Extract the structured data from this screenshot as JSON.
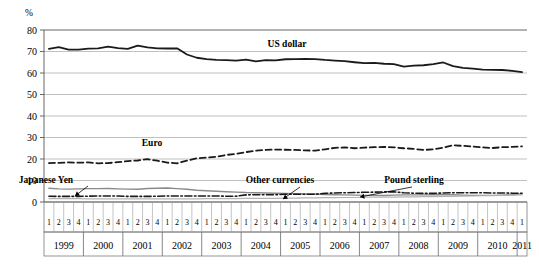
{
  "chart_data": {
    "type": "line",
    "title": "",
    "xlabel": "",
    "ylabel": "%",
    "ylim": [
      0,
      80
    ],
    "yticks": [
      0,
      10,
      20,
      30,
      40,
      50,
      60,
      70,
      80
    ],
    "grid": true,
    "legend_position": "inline-annotations",
    "years": [
      "1999",
      "2000",
      "2001",
      "2002",
      "2003",
      "2004",
      "2005",
      "2006",
      "2007",
      "2008",
      "2009",
      "2010",
      "2011"
    ],
    "quarters_per_year": [
      4,
      4,
      4,
      4,
      4,
      4,
      4,
      4,
      4,
      4,
      4,
      4,
      1
    ],
    "quarter_labels": [
      "1",
      "2",
      "3",
      "4"
    ],
    "x": [
      "1999 Q1",
      "1999 Q2",
      "1999 Q3",
      "1999 Q4",
      "2000 Q1",
      "2000 Q2",
      "2000 Q3",
      "2000 Q4",
      "2001 Q1",
      "2001 Q2",
      "2001 Q3",
      "2001 Q4",
      "2002 Q1",
      "2002 Q2",
      "2002 Q3",
      "2002 Q4",
      "2003 Q1",
      "2003 Q2",
      "2003 Q3",
      "2003 Q4",
      "2004 Q1",
      "2004 Q2",
      "2004 Q3",
      "2004 Q4",
      "2005 Q1",
      "2005 Q2",
      "2005 Q3",
      "2005 Q4",
      "2006 Q1",
      "2006 Q2",
      "2006 Q3",
      "2006 Q4",
      "2007 Q1",
      "2007 Q2",
      "2007 Q3",
      "2007 Q4",
      "2008 Q1",
      "2008 Q2",
      "2008 Q3",
      "2008 Q4",
      "2009 Q1",
      "2009 Q2",
      "2009 Q3",
      "2009 Q4",
      "2010 Q1",
      "2010 Q2",
      "2010 Q3",
      "2010 Q4",
      "2011 Q1"
    ],
    "series": [
      {
        "name": "US dollar",
        "style": "solid",
        "color": "#1a1a1a",
        "width": 1.8,
        "label_x": 287,
        "label_y": 47,
        "values": [
          71.2,
          72.0,
          70.9,
          70.9,
          71.3,
          71.5,
          72.3,
          71.6,
          71.2,
          72.7,
          71.9,
          71.5,
          71.4,
          71.5,
          68.6,
          67.1,
          66.5,
          66.1,
          66.0,
          65.8,
          66.2,
          65.4,
          66.0,
          65.9,
          66.4,
          66.5,
          66.6,
          66.5,
          66.1,
          65.8,
          65.5,
          65.0,
          64.6,
          64.7,
          64.3,
          64.1,
          63.0,
          63.4,
          63.6,
          64.1,
          64.9,
          63.2,
          62.4,
          62.0,
          61.6,
          61.5,
          61.4,
          61.0,
          60.4
        ]
      },
      {
        "name": "Euro",
        "style": "dashed",
        "color": "#1a1a1a",
        "width": 1.8,
        "label_x": 152,
        "label_y": 146,
        "values": [
          18.1,
          18.2,
          18.4,
          18.3,
          18.4,
          18.0,
          18.1,
          18.5,
          19.0,
          19.3,
          19.9,
          19.2,
          18.3,
          18.0,
          19.2,
          20.3,
          20.7,
          21.0,
          21.9,
          22.4,
          23.2,
          23.9,
          24.2,
          24.4,
          24.3,
          24.2,
          24.0,
          23.9,
          24.5,
          25.2,
          25.4,
          25.0,
          25.3,
          25.5,
          25.6,
          25.4,
          25.0,
          24.7,
          24.2,
          24.5,
          25.3,
          26.4,
          26.1,
          25.8,
          25.4,
          25.1,
          25.5,
          25.6,
          25.9
        ]
      },
      {
        "name": "Japanese Yen",
        "style": "solid",
        "color": "#8a8a8a",
        "width": 1.4,
        "label_x": 46,
        "label_y": 183,
        "leader": {
          "x1": 88,
          "y1": 186,
          "x2": 75,
          "y2": 196
        },
        "values": [
          6.4,
          6.1,
          6.0,
          6.1,
          6.2,
          6.2,
          6.3,
          6.1,
          6.0,
          5.9,
          6.3,
          6.4,
          6.5,
          6.2,
          5.9,
          5.5,
          5.2,
          5.0,
          4.8,
          4.6,
          4.4,
          4.3,
          4.2,
          4.1,
          4.0,
          3.9,
          3.8,
          3.7,
          3.5,
          3.4,
          3.3,
          3.2,
          3.1,
          3.0,
          3.0,
          3.2,
          3.3,
          3.3,
          3.3,
          3.4,
          3.5,
          3.4,
          3.2,
          3.1,
          3.1,
          3.1,
          3.2,
          3.4,
          3.8
        ]
      },
      {
        "name": "Pound sterling",
        "style": "dashdot",
        "color": "#1a1a1a",
        "width": 1.6,
        "label_x": 414,
        "label_y": 183,
        "leader": {
          "x1": 412,
          "y1": 187,
          "x2": 360,
          "y2": 197
        },
        "values": [
          2.7,
          2.6,
          2.6,
          2.6,
          2.7,
          2.8,
          2.8,
          2.8,
          2.6,
          2.6,
          2.6,
          2.7,
          2.8,
          2.8,
          2.8,
          2.8,
          2.8,
          2.8,
          2.7,
          2.7,
          3.3,
          3.4,
          3.4,
          3.4,
          3.6,
          3.6,
          3.6,
          3.6,
          4.0,
          4.2,
          4.3,
          4.4,
          4.5,
          4.6,
          4.7,
          4.7,
          4.3,
          4.1,
          4.0,
          4.0,
          4.2,
          4.3,
          4.3,
          4.3,
          4.3,
          4.2,
          4.2,
          4.1,
          4.1
        ]
      },
      {
        "name": "Other currencies",
        "style": "solid",
        "color": "#b3b3b3",
        "width": 1.2,
        "label_x": 280,
        "label_y": 183,
        "leader": {
          "x1": 300,
          "y1": 187,
          "x2": 283,
          "y2": 199
        },
        "values": [
          1.6,
          1.6,
          1.6,
          1.6,
          1.5,
          1.5,
          1.5,
          1.5,
          1.5,
          1.5,
          1.5,
          1.5,
          1.5,
          1.5,
          1.5,
          1.5,
          1.6,
          1.6,
          1.6,
          1.6,
          1.7,
          1.7,
          1.7,
          1.7,
          1.8,
          1.8,
          1.9,
          1.9,
          2.0,
          2.0,
          2.1,
          2.1,
          2.2,
          2.2,
          2.3,
          2.3,
          2.4,
          2.4,
          2.5,
          2.5,
          2.6,
          2.6,
          2.7,
          2.8,
          2.9,
          3.0,
          3.1,
          3.2,
          3.3
        ]
      }
    ]
  },
  "axis": {
    "unit_label": "%"
  }
}
